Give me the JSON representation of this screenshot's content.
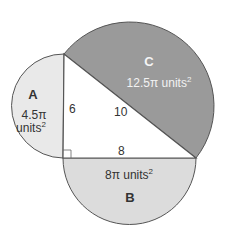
{
  "diagram": {
    "triangle": {
      "vertices": {
        "top": [
          64,
          54
        ],
        "right_angle": [
          63,
          158
        ],
        "bottom_right": [
          196,
          158
        ]
      },
      "side_labels": {
        "vertical_leg": "6",
        "hypotenuse": "10",
        "horizontal_leg": "8"
      },
      "right_angle_marker": true
    },
    "regions": [
      {
        "id": "A",
        "letter": "A",
        "area_line1": "4.5π",
        "area_line2": "units",
        "area_exponent": "2",
        "fill": "#e9e9e9"
      },
      {
        "id": "B",
        "letter": "B",
        "area_text": "8π units",
        "area_exponent": "2",
        "fill": "#dcdcdc"
      },
      {
        "id": "C",
        "letter": "C",
        "area_text": "12.5π units",
        "area_exponent": "2",
        "fill": "#9a9a9a"
      }
    ],
    "colors": {
      "stroke": "#555555",
      "triangle_fill": "#ffffff",
      "text_dark": "#333333",
      "text_light": "#f2f2f2"
    }
  }
}
